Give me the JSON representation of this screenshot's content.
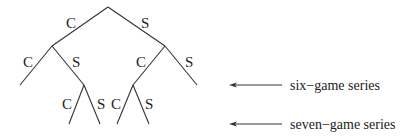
{
  "diagram": {
    "type": "tree",
    "nodes": [
      {
        "id": "root",
        "x": 108,
        "y": 7
      },
      {
        "id": "C",
        "x": 52,
        "y": 46
      },
      {
        "id": "S",
        "x": 165,
        "y": 46
      },
      {
        "id": "CC",
        "x": 20,
        "y": 85
      },
      {
        "id": "CS",
        "x": 84,
        "y": 85
      },
      {
        "id": "SC",
        "x": 133,
        "y": 85
      },
      {
        "id": "SS",
        "x": 197,
        "y": 85
      },
      {
        "id": "CSC",
        "x": 69,
        "y": 124
      },
      {
        "id": "CSS",
        "x": 100,
        "y": 124
      },
      {
        "id": "SCC",
        "x": 117,
        "y": 124
      },
      {
        "id": "SCS",
        "x": 149,
        "y": 124
      }
    ],
    "edges": [
      {
        "from": "root",
        "to": "C",
        "label": "C",
        "lx": 66,
        "ly": 28
      },
      {
        "from": "root",
        "to": "S",
        "label": "S",
        "lx": 141,
        "ly": 28
      },
      {
        "from": "C",
        "to": "CC",
        "label": "C",
        "lx": 23,
        "ly": 67
      },
      {
        "from": "C",
        "to": "CS",
        "label": "S",
        "lx": 72,
        "ly": 67
      },
      {
        "from": "S",
        "to": "SC",
        "label": "C",
        "lx": 136,
        "ly": 67
      },
      {
        "from": "S",
        "to": "SS",
        "label": "S",
        "lx": 185,
        "ly": 67
      },
      {
        "from": "CS",
        "to": "CSC",
        "label": "C",
        "lx": 62,
        "ly": 109
      },
      {
        "from": "CS",
        "to": "CSS",
        "label": "S",
        "lx": 97,
        "ly": 109
      },
      {
        "from": "SC",
        "to": "SCC",
        "label": "C",
        "lx": 111,
        "ly": 109
      },
      {
        "from": "SC",
        "to": "SCS",
        "label": "S",
        "lx": 145,
        "ly": 109
      }
    ],
    "annotations": [
      {
        "text": "six−game series",
        "arrow_y": 85,
        "arrow_x1": 229,
        "arrow_x2": 282,
        "text_x": 290,
        "text_y": 90
      },
      {
        "text": "seven−game series",
        "arrow_y": 124,
        "arrow_x1": 229,
        "arrow_x2": 282,
        "text_x": 290,
        "text_y": 129
      }
    ]
  }
}
